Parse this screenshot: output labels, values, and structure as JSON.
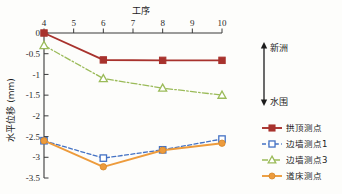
{
  "chart_data": {
    "type": "line",
    "title": "",
    "xlabel": "工序",
    "ylabel": "水平位移 (mm)",
    "x": [
      4,
      5,
      6,
      7,
      8,
      9,
      10
    ],
    "xticklabels": [
      "4",
      "5",
      "6",
      "7",
      "8",
      "9",
      "10"
    ],
    "xlim": [
      4,
      10
    ],
    "ylim": [
      -3.5,
      0
    ],
    "yticks": [
      0,
      -0.5,
      -1,
      -1.5,
      -2,
      -2.5,
      -3,
      -3.5
    ],
    "yticklabels": [
      "0",
      "-0.5",
      "-1",
      "-1.5",
      "-2",
      "-2.5",
      "-3",
      "-3.5"
    ],
    "grid": false,
    "legend_position": "right",
    "xaxis_position": "top",
    "series": [
      {
        "name": "拱顶测点",
        "color": "#A8322D",
        "marker": "filled-square",
        "linestyle": "solid",
        "x": [
          4,
          6,
          8,
          10
        ],
        "values": [
          0,
          -0.65,
          -0.66,
          -0.66
        ]
      },
      {
        "name": "边墙测点1",
        "color": "#4472C4",
        "marker": "open-square",
        "linestyle": "dashed",
        "x": [
          4,
          6,
          8,
          10
        ],
        "values": [
          -2.6,
          -3.02,
          -2.82,
          -2.56
        ]
      },
      {
        "name": "边墙测点3",
        "color": "#9BBB59",
        "marker": "open-triangle",
        "linestyle": "dashdot",
        "x": [
          4,
          6,
          8,
          10
        ],
        "values": [
          -0.3,
          -1.1,
          -1.33,
          -1.5
        ]
      },
      {
        "name": "道床测点",
        "color": "#ED9B3C",
        "marker": "filled-circle",
        "linestyle": "solid",
        "x": [
          4,
          6,
          8,
          10
        ],
        "values": [
          -2.6,
          -3.23,
          -2.83,
          -2.66
        ]
      }
    ],
    "annotations": [
      {
        "label": "新洲",
        "direction": "up"
      },
      {
        "label": "水围",
        "direction": "down"
      }
    ]
  }
}
